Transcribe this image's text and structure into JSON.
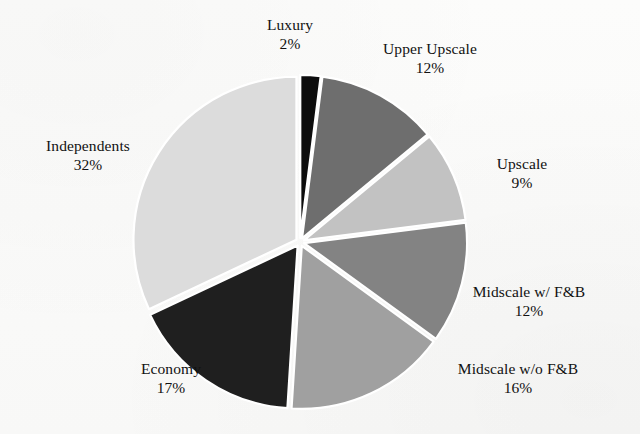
{
  "chart_data": {
    "type": "pie",
    "title": "",
    "subtitle": "",
    "xlabel": "",
    "ylabel": "",
    "legend_position": "labels-outside",
    "grid": false,
    "units": "percent",
    "start_angle_deg": 0,
    "direction": "clockwise",
    "exploded": true,
    "categories": [
      "Luxury",
      "Upper Upscale",
      "Upscale",
      "Midscale w/ F&B",
      "Midscale w/o F&B",
      "Economy",
      "Independents"
    ],
    "values": [
      2,
      12,
      9,
      12,
      16,
      17,
      32
    ],
    "labels": [
      {
        "name": "Luxury",
        "value": 2,
        "value_text": "2%",
        "color": "#0d0d0d"
      },
      {
        "name": "Upper Upscale",
        "value": 12,
        "value_text": "12%",
        "color": "#6e6e6e"
      },
      {
        "name": "Upscale",
        "value": 9,
        "value_text": "9%",
        "color": "#c2c2c2"
      },
      {
        "name": "Midscale w/ F&B",
        "value": 12,
        "value_text": "12%",
        "color": "#838383"
      },
      {
        "name": "Midscale w/o F&B",
        "value": 16,
        "value_text": "16%",
        "color": "#a0a0a0"
      },
      {
        "name": "Economy",
        "value": 17,
        "value_text": "17%",
        "color": "#1f1f1f"
      },
      {
        "name": "Independents",
        "value": 32,
        "value_text": "32%",
        "color": "#dcdcdc"
      }
    ],
    "colors": [
      "#0d0d0d",
      "#6e6e6e",
      "#c2c2c2",
      "#838383",
      "#a0a0a0",
      "#1f1f1f",
      "#dcdcdc"
    ],
    "slice_separator_color": "#ffffff",
    "background_color": "#fbfbfa"
  },
  "slices": {
    "luxury": {
      "name": "Luxury",
      "value_text": "2%"
    },
    "upper_upscale": {
      "name": "Upper Upscale",
      "value_text": "12%"
    },
    "upscale": {
      "name": "Upscale",
      "value_text": "9%"
    },
    "midscale_w_fb": {
      "name": "Midscale w/ F&B",
      "value_text": "12%"
    },
    "midscale_wo_fb": {
      "name": "Midscale w/o F&B",
      "value_text": "16%"
    },
    "economy": {
      "name": "Economy",
      "value_text": "17%"
    },
    "independents": {
      "name": "Independents",
      "value_text": "32%"
    }
  }
}
